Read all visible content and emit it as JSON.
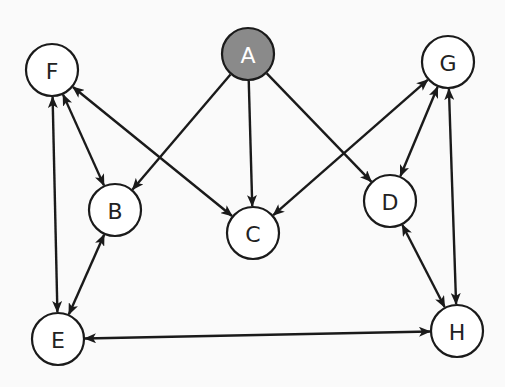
{
  "diagram": {
    "type": "directed-graph",
    "colors": {
      "background": "#fafafa",
      "stroke": "#1a1a1a",
      "node_fill": "#ffffff",
      "highlight_fill": "#8a8a8a",
      "highlight_text": "#ffffff",
      "text": "#222222"
    },
    "node_radius": 26,
    "nodes": [
      {
        "id": "A",
        "label": "A",
        "x": 248,
        "y": 54,
        "highlighted": true
      },
      {
        "id": "F",
        "label": "F",
        "x": 52,
        "y": 70,
        "highlighted": false
      },
      {
        "id": "G",
        "label": "G",
        "x": 448,
        "y": 62,
        "highlighted": false
      },
      {
        "id": "B",
        "label": "B",
        "x": 115,
        "y": 210,
        "highlighted": false
      },
      {
        "id": "C",
        "label": "C",
        "x": 253,
        "y": 233,
        "highlighted": false
      },
      {
        "id": "D",
        "label": "D",
        "x": 390,
        "y": 201,
        "highlighted": false
      },
      {
        "id": "E",
        "label": "E",
        "x": 58,
        "y": 339,
        "highlighted": false
      },
      {
        "id": "H",
        "label": "H",
        "x": 457,
        "y": 331,
        "highlighted": false
      }
    ],
    "edges": [
      {
        "from": "A",
        "to": "B",
        "bidirectional": false
      },
      {
        "from": "A",
        "to": "C",
        "bidirectional": false
      },
      {
        "from": "A",
        "to": "D",
        "bidirectional": false
      },
      {
        "from": "F",
        "to": "B",
        "bidirectional": true
      },
      {
        "from": "F",
        "to": "C",
        "bidirectional": true
      },
      {
        "from": "F",
        "to": "E",
        "bidirectional": true
      },
      {
        "from": "G",
        "to": "C",
        "bidirectional": true
      },
      {
        "from": "G",
        "to": "D",
        "bidirectional": true
      },
      {
        "from": "G",
        "to": "H",
        "bidirectional": true
      },
      {
        "from": "B",
        "to": "E",
        "bidirectional": true
      },
      {
        "from": "E",
        "to": "H",
        "bidirectional": true
      },
      {
        "from": "D",
        "to": "H",
        "bidirectional": true
      }
    ]
  }
}
